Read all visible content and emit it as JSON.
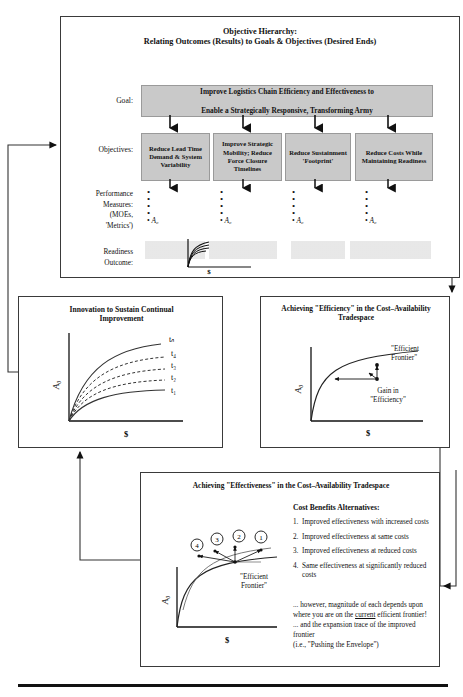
{
  "top_panel": {
    "title_line1": "Objective Hierarchy:",
    "title_line2": "Relating Outcomes (Results) to Goals & Objectives (Desired Ends)",
    "goal_label": "Goal:",
    "goal_text_line1": "Improve Logistics Chain Efficiency and Effectiveness to",
    "goal_text_line2": "Enable a Strategically Responsive, Transforming Army",
    "objectives_label": "Objectives:",
    "objectives": [
      "Reduce Lead Time Demand & System Variability",
      "Improve Strategic Mobility; Reduce Force Closure Timelines",
      "Reduce Sustainment 'Footprint'",
      "Reduce Costs While Maintaining Readiness"
    ],
    "performance_label_line1": "Performance",
    "performance_label_line2": "Measures:",
    "performance_label_line3": "(MOEs,",
    "performance_label_line4": "'Metrics')",
    "measure_symbol": "A₀",
    "readiness_label_line1": "Readiness",
    "readiness_label_line2": "Outcome:",
    "readiness_axis_x": "$"
  },
  "innovation_panel": {
    "title_line1": "Innovation to Sustain Continual",
    "title_line2": "Improvement",
    "y_axis": "A₀",
    "x_axis": "$",
    "curve_labels": [
      "t₁",
      "t₂",
      "t₃",
      "t₄",
      "tₙ"
    ]
  },
  "efficiency_panel": {
    "title_line1": "Achieving \"Efficiency\" in the Cost–Availability",
    "title_line2": "Tradespace",
    "y_axis": "A₀",
    "x_axis": "$",
    "frontier_label_line1": "\"Efficient",
    "frontier_label_line2": "Frontier\"",
    "gain_label_line1": "Gain in",
    "gain_label_line2": "\"Efficiency\""
  },
  "effectiveness_panel": {
    "title": "Achieving \"Effectiveness\" in the Cost–Availability Tradespace",
    "y_axis": "A₀",
    "x_axis": "$",
    "frontier_label_line1": "\"Efficient",
    "frontier_label_line2": "Frontier\"",
    "markers": [
      "1",
      "2",
      "3",
      "4"
    ],
    "alternatives_heading": "Cost Benefits Alternatives:",
    "alternatives": [
      {
        "num": "1.",
        "text": "Improved effectiveness with increased costs"
      },
      {
        "num": "2.",
        "text": "Improved effectiveness at same costs"
      },
      {
        "num": "3.",
        "text": "Improved effectiveness at reduced costs"
      },
      {
        "num": "4.",
        "text": "Same effectiveness at significantly reduced costs"
      }
    ],
    "note1_a": "... however, magnitude of each depends upon where you are on the ",
    "note1_underline": "current",
    "note1_b": " efficient frontier!",
    "note2": "... and the expansion trace of the improved frontier",
    "note3": "(i.e., \"Pushing the Envelope\")"
  }
}
